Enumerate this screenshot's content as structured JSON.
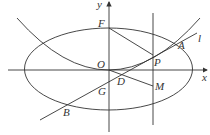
{
  "diagram": {
    "axes": {
      "x_label": "x",
      "y_label": "y"
    },
    "points": [
      {
        "name": "F",
        "label": "F"
      },
      {
        "name": "O",
        "label": "O"
      },
      {
        "name": "P",
        "label": "P"
      },
      {
        "name": "A",
        "label": "A"
      },
      {
        "name": "l",
        "label": "l"
      },
      {
        "name": "D",
        "label": "D"
      },
      {
        "name": "M",
        "label": "M"
      },
      {
        "name": "G",
        "label": "G"
      },
      {
        "name": "B",
        "label": "B"
      }
    ],
    "colors": {
      "stroke": "#333333",
      "background": "#ffffff"
    }
  }
}
